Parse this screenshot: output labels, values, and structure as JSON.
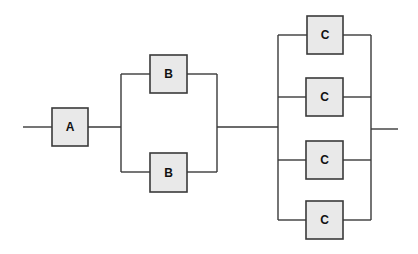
{
  "diagram": {
    "type": "reliability-block-diagram",
    "colors": {
      "wire": "#3a3a3a",
      "block_fill": "#e9e9e9",
      "block_border": "#3a3a3a",
      "label": "#111111"
    },
    "stages": [
      {
        "name": "stage-a",
        "configuration": "single",
        "blocks": [
          {
            "label": "A"
          }
        ]
      },
      {
        "name": "stage-b",
        "configuration": "parallel",
        "blocks": [
          {
            "label": "B"
          },
          {
            "label": "B"
          }
        ]
      },
      {
        "name": "stage-c",
        "configuration": "parallel",
        "blocks": [
          {
            "label": "C"
          },
          {
            "label": "C"
          },
          {
            "label": "C"
          },
          {
            "label": "C"
          }
        ]
      }
    ]
  }
}
